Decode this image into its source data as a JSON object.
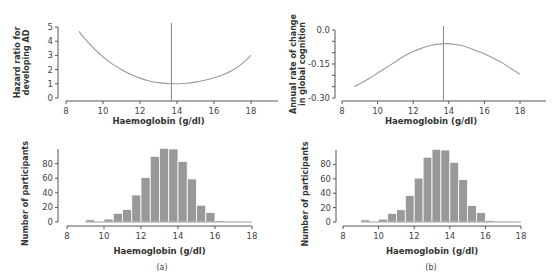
{
  "figure": {
    "panel_labels": [
      "(a)",
      "(b)"
    ]
  },
  "chart_data": [
    {
      "id": "a_top",
      "type": "line",
      "title": "",
      "xlabel": "Haemoglobin (g/dl)",
      "ylabel_lines": [
        "Hazard ratio for",
        "developing AD"
      ],
      "xlim": [
        8,
        18
      ],
      "ylim": [
        0,
        5
      ],
      "xticks": [
        8,
        10,
        12,
        14,
        16,
        18
      ],
      "yticks": [
        0,
        1,
        2,
        3,
        4,
        5
      ],
      "ytick_labels": [
        "0",
        "1",
        "2",
        "3",
        "4",
        "5"
      ],
      "reference_line_x": 13.7,
      "series": [
        {
          "name": "Hazard ratio",
          "x": [
            8.7,
            9.0,
            9.5,
            10.0,
            10.5,
            11.0,
            11.5,
            12.0,
            12.5,
            13.0,
            13.7,
            14.5,
            15.0,
            15.5,
            16.0,
            16.5,
            17.0,
            17.5,
            18.0
          ],
          "y": [
            4.7,
            4.2,
            3.5,
            2.9,
            2.4,
            2.0,
            1.65,
            1.4,
            1.2,
            1.08,
            1.0,
            1.04,
            1.12,
            1.25,
            1.42,
            1.65,
            1.95,
            2.4,
            3.0
          ]
        }
      ],
      "grid": false,
      "legend": null
    },
    {
      "id": "b_top",
      "type": "line",
      "title": "",
      "xlabel": "Haemoglobin (g/dl)",
      "ylabel_lines": [
        "Annual rate of change",
        "in global cognition"
      ],
      "xlim": [
        8,
        18
      ],
      "ylim": [
        -0.3,
        0.0
      ],
      "xticks": [
        8,
        10,
        12,
        14,
        16,
        18
      ],
      "yticks": [
        0.0,
        -0.05,
        -0.1,
        -0.15,
        -0.2,
        -0.25,
        -0.3
      ],
      "ytick_labels": [
        "0.0",
        "",
        "",
        "-0.15",
        "",
        "",
        "-0.30"
      ],
      "reference_line_x": 13.7,
      "series": [
        {
          "name": "Annual rate of change",
          "x": [
            8.7,
            9.5,
            10.0,
            10.5,
            11.0,
            11.5,
            12.0,
            12.5,
            13.0,
            13.7,
            14.5,
            15.0,
            15.5,
            16.0,
            16.5,
            17.0,
            17.5,
            18.0
          ],
          "y": [
            -0.25,
            -0.215,
            -0.19,
            -0.165,
            -0.14,
            -0.115,
            -0.095,
            -0.08,
            -0.068,
            -0.06,
            -0.065,
            -0.075,
            -0.09,
            -0.105,
            -0.125,
            -0.145,
            -0.17,
            -0.195
          ]
        }
      ],
      "grid": false,
      "legend": null
    },
    {
      "id": "a_bottom",
      "type": "bar",
      "title": "",
      "xlabel": "Haemoglobin (g/dl)",
      "ylabel": "Number of participants",
      "xlim": [
        8,
        18
      ],
      "ylim": [
        0,
        100
      ],
      "xticks": [
        8,
        10,
        12,
        14,
        16,
        18
      ],
      "yticks": [
        0,
        20,
        40,
        60,
        80
      ],
      "bin_width": 0.5,
      "bin_starts": [
        9.0,
        9.5,
        10.0,
        10.5,
        11.0,
        11.5,
        12.0,
        12.5,
        13.0,
        13.5,
        14.0,
        14.5,
        15.0,
        15.5,
        16.0,
        16.5,
        17.0,
        17.5
      ],
      "values": [
        3,
        0,
        4,
        12,
        17,
        37,
        61,
        90,
        101,
        100,
        83,
        59,
        23,
        13,
        2,
        1,
        1,
        0
      ],
      "grid": false,
      "legend": null
    },
    {
      "id": "b_bottom",
      "type": "bar",
      "title": "",
      "xlabel": "Haemoglobin (g/dl)",
      "ylabel": "Number of participants",
      "xlim": [
        8,
        18
      ],
      "ylim": [
        0,
        100
      ],
      "xticks": [
        8,
        10,
        12,
        14,
        16,
        18
      ],
      "yticks": [
        0,
        20,
        40,
        60,
        80
      ],
      "bin_width": 0.5,
      "bin_starts": [
        9.0,
        9.5,
        10.0,
        10.5,
        11.0,
        11.5,
        12.0,
        12.5,
        13.0,
        13.5,
        14.0,
        14.5,
        15.0,
        15.5,
        16.0,
        16.5,
        17.0,
        17.5
      ],
      "values": [
        3,
        0,
        4,
        12,
        17,
        37,
        61,
        90,
        101,
        100,
        83,
        59,
        23,
        13,
        2,
        1,
        1,
        0
      ],
      "grid": false,
      "legend": null
    }
  ],
  "colors": {
    "axis": "#555555",
    "curve": "#9a9a9a",
    "reference_line": "#777777",
    "bar_fill": "#999999",
    "bar_stroke": "#ffffff"
  }
}
